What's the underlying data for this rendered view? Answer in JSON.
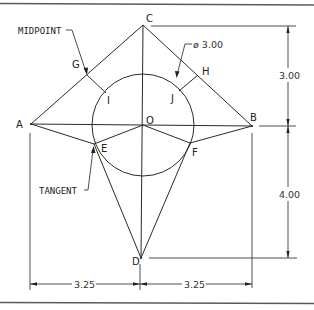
{
  "points": {
    "A": {
      "label": "A"
    },
    "B": {
      "label": "B"
    },
    "C": {
      "label": "C"
    },
    "D": {
      "label": "D"
    },
    "O": {
      "label": "O"
    },
    "E": {
      "label": "E"
    },
    "F": {
      "label": "F"
    },
    "G": {
      "label": "G"
    },
    "H": {
      "label": "H"
    },
    "I": {
      "label": "I"
    },
    "J": {
      "label": "J"
    }
  },
  "annotations": {
    "midpoint": "MIDPOINT",
    "tangent": "TANGENT",
    "diameter": "ø 3.00"
  },
  "dimensions": {
    "vertical_top": "3.00",
    "vertical_bottom": "4.00",
    "horizontal_left": "3.25",
    "horizontal_right": "3.25"
  }
}
